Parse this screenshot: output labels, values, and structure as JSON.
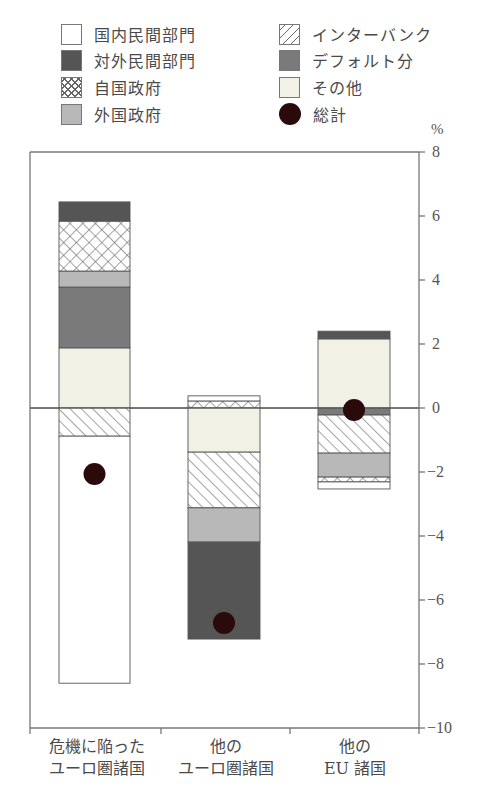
{
  "legend": [
    {
      "key": "domestic_private",
      "label": "国内民間部門",
      "pattern": "white",
      "icon": "white-square-icon"
    },
    {
      "key": "foreign_private",
      "label": "対外民間部門",
      "pattern": "dark",
      "icon": "dark-square-icon"
    },
    {
      "key": "own_government",
      "label": "自国政府",
      "pattern": "crosshatch",
      "icon": "crosshatch-square-icon"
    },
    {
      "key": "foreign_government",
      "label": "外国政府",
      "pattern": "lightgrey",
      "icon": "lightgrey-square-icon"
    },
    {
      "key": "interbank",
      "label": "インターバンク",
      "pattern": "diagonal",
      "icon": "diagonal-hatch-square-icon"
    },
    {
      "key": "default",
      "label": "デフォルト分",
      "pattern": "midgrey",
      "icon": "midgrey-square-icon"
    },
    {
      "key": "other",
      "label": "その他",
      "pattern": "cream",
      "icon": "cream-square-icon"
    },
    {
      "key": "total",
      "label": "総計",
      "pattern": "dot",
      "icon": "black-dot-icon"
    }
  ],
  "axis": {
    "unit": "%",
    "ticks": [
      "8",
      "6",
      "4",
      "2",
      "0",
      "−2",
      "−4",
      "−6",
      "−8",
      "−10"
    ]
  },
  "categories": [
    {
      "line1": "危機に陥った",
      "line2": "ユーロ圏諸国"
    },
    {
      "line1": "他の",
      "line2": "ユーロ圏諸国"
    },
    {
      "line1": "他の",
      "line2": "EU 諸国"
    }
  ],
  "colors": {
    "dark": "#555555",
    "midgrey": "#7a7a7a",
    "lightgrey": "#b8b8b8",
    "cream": "#f1f1e6",
    "white": "#ffffff",
    "dot": "#2a0a0a",
    "line": "#777777"
  },
  "chart_data": {
    "type": "bar",
    "stacked": true,
    "title": "",
    "xlabel": "",
    "ylabel": "%",
    "ylim": [
      -10,
      8
    ],
    "yticks": [
      8,
      6,
      4,
      2,
      0,
      -2,
      -4,
      -6,
      -8,
      -10
    ],
    "y_axis_position": "right",
    "grid": false,
    "legend_position": "top",
    "categories": [
      "危機に陥ったユーロ圏諸国",
      "他のユーロ圏諸国",
      "他のEU諸国"
    ],
    "series": [
      {
        "name": "国内民間部門",
        "values": [
          -7.72,
          0.16,
          -0.22
        ]
      },
      {
        "name": "対外民間部門",
        "values": [
          0.6,
          -3.03,
          0.24
        ]
      },
      {
        "name": "自国政府",
        "values": [
          1.56,
          0.22,
          -0.15
        ]
      },
      {
        "name": "外国政府",
        "values": [
          0.5,
          -1.07,
          -0.75
        ]
      },
      {
        "name": "インターバンク",
        "values": [
          -0.88,
          -1.74,
          -1.19
        ]
      },
      {
        "name": "デフォルト分",
        "values": [
          1.9,
          0,
          -0.22
        ]
      },
      {
        "name": "その他",
        "values": [
          1.88,
          -1.38,
          2.16
        ]
      },
      {
        "name": "総計",
        "type": "scatter",
        "values": [
          -2.06,
          -6.72,
          -0.06
        ]
      }
    ],
    "stack_order": {
      "危機に陥ったユーロ圏諸国": {
        "positive_bottom_to_top": [
          "その他",
          "デフォルト分",
          "外国政府",
          "自国政府",
          "対外民間部門"
        ],
        "negative_top_to_bottom": [
          "インターバンク",
          "国内民間部門"
        ]
      },
      "他のユーロ圏諸国": {
        "positive_bottom_to_top": [
          "自国政府",
          "国内民間部門"
        ],
        "negative_top_to_bottom": [
          "その他",
          "インターバンク",
          "外国政府",
          "対外民間部門"
        ]
      },
      "他のEU諸国": {
        "positive_bottom_to_top": [
          "その他",
          "対外民間部門"
        ],
        "negative_top_to_bottom": [
          "デフォルト分",
          "インターバンク",
          "外国政府",
          "自国政府",
          "国内民間部門"
        ]
      }
    }
  },
  "bars": [
    {
      "x": 59,
      "w": 71,
      "dot": -2.06,
      "segments": [
        {
          "from": 0,
          "to": 1.88,
          "pattern": "cream"
        },
        {
          "from": 1.88,
          "to": 3.78,
          "pattern": "midgrey"
        },
        {
          "from": 3.78,
          "to": 4.28,
          "pattern": "lightgrey"
        },
        {
          "from": 4.28,
          "to": 5.84,
          "pattern": "crosshatch"
        },
        {
          "from": 5.84,
          "to": 6.44,
          "pattern": "dark"
        },
        {
          "from": 0,
          "to": -0.88,
          "pattern": "diagonal"
        },
        {
          "from": -0.88,
          "to": -8.6,
          "pattern": "white"
        }
      ]
    },
    {
      "x": 188,
      "w": 72,
      "dot": -6.72,
      "segments": [
        {
          "from": 0,
          "to": 0.22,
          "pattern": "crosshatch"
        },
        {
          "from": 0.22,
          "to": 0.38,
          "pattern": "white"
        },
        {
          "from": 0,
          "to": -1.38,
          "pattern": "cream"
        },
        {
          "from": -1.38,
          "to": -3.12,
          "pattern": "diagonal"
        },
        {
          "from": -3.12,
          "to": -4.19,
          "pattern": "lightgrey"
        },
        {
          "from": -4.19,
          "to": -7.22,
          "pattern": "dark"
        }
      ]
    },
    {
      "x": 318,
      "w": 72,
      "dot": -0.06,
      "segments": [
        {
          "from": 0,
          "to": 2.16,
          "pattern": "cream"
        },
        {
          "from": 2.16,
          "to": 2.4,
          "pattern": "dark"
        },
        {
          "from": 0,
          "to": -0.22,
          "pattern": "midgrey"
        },
        {
          "from": -0.22,
          "to": -1.41,
          "pattern": "diagonal"
        },
        {
          "from": -1.41,
          "to": -2.16,
          "pattern": "lightgrey"
        },
        {
          "from": -2.16,
          "to": -2.31,
          "pattern": "crosshatch"
        },
        {
          "from": -2.31,
          "to": -2.53,
          "pattern": "white"
        }
      ]
    }
  ]
}
